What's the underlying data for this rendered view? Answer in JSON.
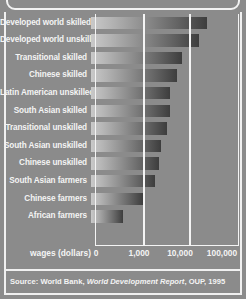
{
  "chart_data": {
    "type": "bar",
    "orientation": "horizontal",
    "title": "",
    "xlabel": "wages (dollars)",
    "ylabel": "",
    "scale": "log",
    "grid": true,
    "legend": null,
    "xticks": [
      "0",
      "1,000",
      "10,000",
      "100,000"
    ],
    "xtick_values": [
      0,
      1000,
      10000,
      100000
    ],
    "xlim": [
      0,
      100000
    ],
    "categories": [
      "Developed world skilled",
      "Developed world unskilled",
      "Transitional  skilled",
      "Chinese skilled",
      "Latin American unskilled",
      "South Asian skilled",
      "Transitional unskilled",
      "South Asian unskilled",
      "Chinese unskilled",
      "South Asian farmers",
      "Chinese farmers",
      "African farmers"
    ],
    "values": [
      36000,
      23000,
      9000,
      6800,
      4700,
      4700,
      4000,
      3000,
      2700,
      2200,
      1300,
      300
    ],
    "bar_pixel_ends": [
      211,
      203,
      186,
      181,
      174,
      174,
      171,
      165,
      163,
      159,
      147,
      127
    ]
  },
  "axis": {
    "title": "wages (dollars)",
    "ticks": [
      {
        "label": "0",
        "x_px": 96
      },
      {
        "label": "1,000",
        "x_px": 139
      },
      {
        "label": "10,000",
        "x_px": 180
      },
      {
        "label": "100,000",
        "x_px": 222
      }
    ],
    "gridlines_px": [
      142,
      188
    ]
  },
  "bars": [
    {
      "label": "Developed world skilled",
      "value": 36000,
      "end_px": 211
    },
    {
      "label": "Developed world unskilled",
      "value": 23000,
      "end_px": 203
    },
    {
      "label": "Transitional  skilled",
      "value": 9000,
      "end_px": 186
    },
    {
      "label": "Chinese skilled",
      "value": 6800,
      "end_px": 181
    },
    {
      "label": "Latin American unskilled",
      "value": 4700,
      "end_px": 174
    },
    {
      "label": "South Asian skilled",
      "value": 4700,
      "end_px": 174
    },
    {
      "label": "Transitional unskilled",
      "value": 4000,
      "end_px": 171
    },
    {
      "label": "South Asian unskilled",
      "value": 3000,
      "end_px": 165
    },
    {
      "label": "Chinese unskilled",
      "value": 2700,
      "end_px": 163
    },
    {
      "label": "South Asian farmers",
      "value": 2200,
      "end_px": 159
    },
    {
      "label": "Chinese farmers",
      "value": 1300,
      "end_px": 147
    },
    {
      "label": "African farmers",
      "value": 300,
      "end_px": 127
    }
  ],
  "source": {
    "prefix": "Source: World Bank, ",
    "italic": "World Development Report",
    "suffix": ", OUP, 1995",
    "full": "Source: World Bank, World Development Report, OUP, 1995"
  },
  "colors": {
    "background": "#8b8b8b",
    "frame": "#f0f0f0",
    "text": "#f4f4f4",
    "bar_light": "#c9c9c9",
    "bar_dark": "#3d3d3d"
  }
}
